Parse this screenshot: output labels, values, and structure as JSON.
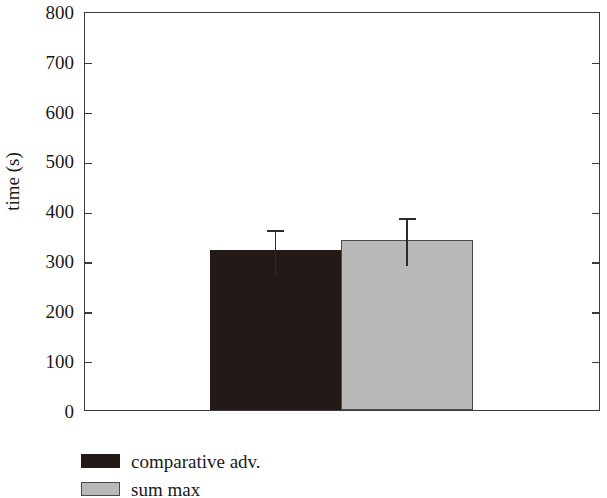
{
  "chart_data": {
    "type": "bar",
    "title": "",
    "xlabel": "",
    "ylabel": "time (s)",
    "ylim": [
      0,
      800
    ],
    "yticks": [
      0,
      100,
      200,
      300,
      400,
      500,
      600,
      700,
      800
    ],
    "ytick_labels": [
      "0",
      "100",
      "200",
      "300",
      "400",
      "500",
      "600",
      "700",
      "800"
    ],
    "grid": false,
    "legend_position": "below-left",
    "categories": [
      "comparative adv.",
      "sum max"
    ],
    "values": [
      320,
      340
    ],
    "errors": [
      45,
      48
    ],
    "error_type": "symmetric",
    "series": [
      {
        "name": "comparative adv.",
        "value": 320,
        "error": 45,
        "error_low": 275,
        "error_high": 365,
        "color": "#231a17"
      },
      {
        "name": "sum max",
        "value": 340,
        "error": 48,
        "error_low": 292,
        "error_high": 388,
        "color": "#b9b9b9"
      }
    ]
  },
  "axis": {
    "y_title": "time (s)",
    "ticks": [
      {
        "label": "800",
        "value": 800
      },
      {
        "label": "700",
        "value": 700
      },
      {
        "label": "600",
        "value": 600
      },
      {
        "label": "500",
        "value": 500
      },
      {
        "label": "400",
        "value": 400
      },
      {
        "label": "300",
        "value": 300
      },
      {
        "label": "200",
        "value": 200
      },
      {
        "label": "100",
        "value": 100
      },
      {
        "label": "0",
        "value": 0
      }
    ]
  },
  "legend": {
    "entries": [
      {
        "label": "comparative adv.",
        "swatch": "dark-swatch-icon",
        "color": "#231a17"
      },
      {
        "label": "sum max",
        "swatch": "light-swatch-icon",
        "color": "#b9b9b9"
      }
    ]
  }
}
